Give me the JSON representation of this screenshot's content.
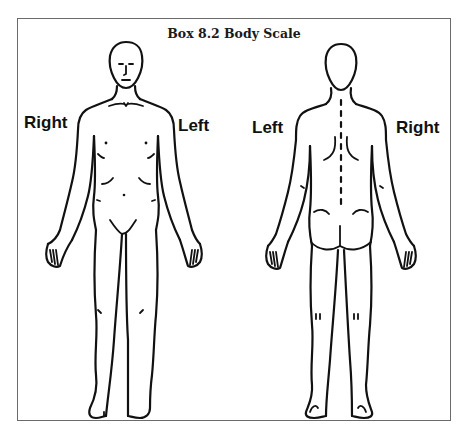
{
  "figure": {
    "title": "Box 8.2 Body Scale",
    "front_view": {
      "label_left_side": "Right",
      "label_right_side": "Left"
    },
    "back_view": {
      "label_left_side": "Left",
      "label_right_side": "Right"
    },
    "colors": {
      "line": "#111111",
      "frame": "#6b6b6b",
      "background": "#ffffff"
    }
  }
}
